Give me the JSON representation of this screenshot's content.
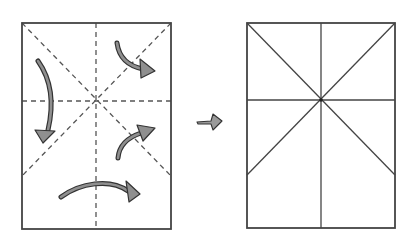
{
  "figure": {
    "description": "Paper folding instructions: fold along dashed crease lines, then result shows creased rectangle",
    "step_before": {
      "label": "Step: fold along dashed lines",
      "rect": {
        "x": 22,
        "y": 23,
        "w": 149,
        "h": 206
      },
      "center": {
        "x": 96,
        "y": 101
      },
      "crease_style": "dashed",
      "arrows": [
        {
          "name": "fold-down-arrow",
          "direction": "down"
        },
        {
          "name": "fold-upper-right-arrow",
          "direction": "down-right"
        },
        {
          "name": "fold-lower-right-arrow",
          "direction": "up-right"
        },
        {
          "name": "fold-bottom-arrow",
          "direction": "right"
        }
      ]
    },
    "transition_arrow": {
      "name": "next-step-arrow",
      "direction": "right"
    },
    "step_after": {
      "label": "Result: creased paper",
      "rect": {
        "x": 247,
        "y": 23,
        "w": 148,
        "h": 205
      },
      "center": {
        "x": 321,
        "y": 100
      },
      "crease_style": "solid"
    },
    "colors": {
      "line": "#444444",
      "arrow_fill": "#8f8f8f",
      "arrow_stroke": "#333333",
      "background": "#ffffff"
    }
  }
}
